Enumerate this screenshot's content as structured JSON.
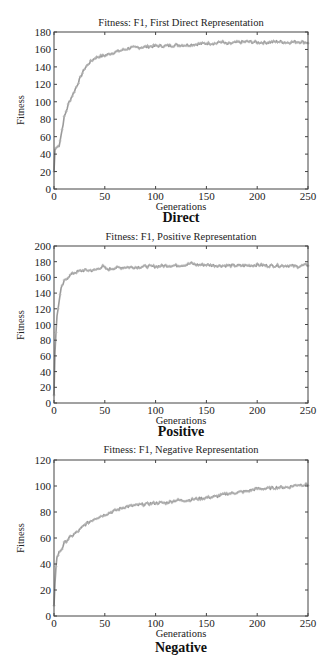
{
  "chart_data": [
    {
      "type": "line",
      "title": "Fitness: F1, First Direct Representation",
      "caption": "Direct",
      "xlabel": "Generations",
      "ylabel": "Fitness",
      "xlim": [
        0,
        250
      ],
      "ylim": [
        0,
        180
      ],
      "xticks": [
        0,
        50,
        100,
        150,
        200,
        250
      ],
      "yticks": [
        0,
        20,
        40,
        60,
        80,
        100,
        120,
        140,
        160,
        180
      ],
      "grid": false,
      "legend": null,
      "series": [
        {
          "name": "Fitness",
          "color": "#9a9a9a",
          "x": [
            0,
            1,
            2,
            5,
            8,
            10,
            15,
            20,
            25,
            30,
            35,
            40,
            45,
            50,
            60,
            70,
            75,
            80,
            90,
            100,
            110,
            120,
            130,
            140,
            150,
            160,
            165,
            170,
            180,
            190,
            200,
            210,
            220,
            230,
            240,
            250
          ],
          "y": [
            20,
            45,
            47,
            50,
            68,
            82,
            100,
            112,
            125,
            138,
            145,
            150,
            152,
            153,
            157,
            160,
            162,
            162,
            163,
            164,
            164,
            165,
            165,
            166,
            167,
            167,
            169,
            166,
            168,
            169,
            168,
            168,
            169,
            168,
            169,
            168
          ]
        }
      ]
    },
    {
      "type": "line",
      "title": "Fitness: F1, Positive Representation",
      "caption": "Positive",
      "xlabel": "Generations",
      "ylabel": "Fitness",
      "xlim": [
        0,
        250
      ],
      "ylim": [
        0,
        200
      ],
      "xticks": [
        0,
        50,
        100,
        150,
        200,
        250
      ],
      "yticks": [
        0,
        20,
        40,
        60,
        80,
        100,
        120,
        140,
        160,
        180,
        200
      ],
      "grid": false,
      "legend": null,
      "series": [
        {
          "name": "Fitness",
          "color": "#9a9a9a",
          "x": [
            0,
            1,
            2,
            3,
            5,
            7,
            10,
            15,
            20,
            25,
            30,
            40,
            48,
            52,
            60,
            70,
            80,
            90,
            100,
            110,
            120,
            130,
            135,
            140,
            150,
            160,
            170,
            180,
            190,
            200,
            210,
            220,
            230,
            240,
            250
          ],
          "y": [
            10,
            65,
            90,
            110,
            130,
            145,
            155,
            162,
            166,
            168,
            169,
            169,
            174,
            170,
            172,
            173,
            173,
            174,
            174,
            175,
            175,
            176,
            178,
            176,
            176,
            175,
            175,
            175,
            175,
            176,
            175,
            175,
            175,
            174,
            176
          ]
        }
      ]
    },
    {
      "type": "line",
      "title": "Fitness: F1, Negative Representation",
      "caption": "Negative",
      "xlabel": "Generations",
      "ylabel": "Fitness",
      "xlim": [
        0,
        250
      ],
      "ylim": [
        0,
        120
      ],
      "xticks": [
        0,
        50,
        100,
        150,
        200,
        250
      ],
      "yticks": [
        0,
        20,
        40,
        60,
        80,
        100,
        120
      ],
      "grid": false,
      "legend": null,
      "series": [
        {
          "name": "Fitness",
          "color": "#9a9a9a",
          "x": [
            0,
            1,
            2,
            3,
            5,
            8,
            10,
            15,
            20,
            25,
            30,
            40,
            50,
            60,
            70,
            80,
            90,
            100,
            110,
            120,
            130,
            140,
            150,
            160,
            170,
            180,
            190,
            200,
            210,
            220,
            230,
            240,
            250
          ],
          "y": [
            8,
            25,
            38,
            45,
            49,
            52,
            56,
            60,
            63,
            66,
            70,
            75,
            78,
            81,
            84,
            85,
            86,
            87,
            87,
            89,
            89,
            90,
            91,
            92,
            94,
            95,
            96,
            98,
            98,
            99,
            99,
            101,
            101
          ]
        }
      ]
    }
  ]
}
